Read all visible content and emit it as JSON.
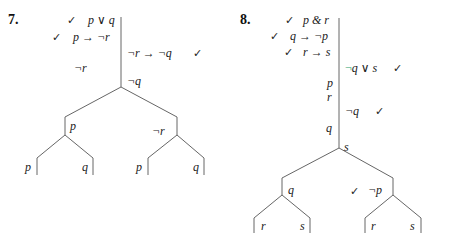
{
  "problems": [
    {
      "number": "7.",
      "premises_left": [
        {
          "checked": true,
          "formula": "p ∨ q"
        },
        {
          "checked": true,
          "formula": "p → ¬r"
        }
      ],
      "trunk_right": [
        {
          "formula": "¬r → ¬q",
          "checked": true
        },
        {
          "formula": "¬q",
          "checked": false
        }
      ],
      "trunk_left": [
        {
          "formula": "¬r"
        }
      ],
      "branches": {
        "left": {
          "label": "p",
          "children": [
            "p",
            "q"
          ]
        },
        "right": {
          "label": "¬r",
          "children": [
            "p",
            "q"
          ]
        }
      }
    },
    {
      "number": "8.",
      "premises_left": [
        {
          "checked": true,
          "formula": "p & r"
        },
        {
          "checked": true,
          "formula": "q → ¬p"
        },
        {
          "checked": true,
          "formula": "r → s"
        }
      ],
      "trunk_right": [
        {
          "formula": "¬q ∨ s",
          "checked": true,
          "neg_color": "#2a9d6a"
        },
        {
          "formula": "¬q",
          "checked": true
        }
      ],
      "trunk_left": [
        {
          "formula": "p"
        },
        {
          "formula": "r"
        },
        {
          "formula": "q"
        }
      ],
      "apex_label": "s",
      "branches": {
        "left": {
          "label": "q",
          "children": [
            "r",
            "s"
          ]
        },
        "right": {
          "label": "¬p",
          "checked": true,
          "children": [
            "r",
            "s"
          ]
        }
      }
    }
  ],
  "glyphs": {
    "check": "✓"
  },
  "colors": {
    "line": "#666666",
    "text": "#222222",
    "accent_negation": "#2a9d6a"
  }
}
